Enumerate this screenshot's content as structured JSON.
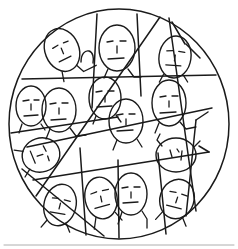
{
  "image": {
    "title": "Circle of Faces",
    "description": "Hand-drawn sketch of a large circle subdivided by straight chords into irregular sectors, each sector containing a simple cartoon person with an oval head, minimal facial features and shoulders.",
    "medium": "pen-and-ink line drawing",
    "background_color": "#ffffff",
    "ink_color": "#1a1a1a",
    "artifact_color": "#9b9b9b",
    "width": 238,
    "height": 249,
    "person_count": 15
  },
  "circle": {
    "name": "boundary-circle",
    "center_x": 119,
    "center_y": 124,
    "radius_x": 110,
    "radius_y": 115
  },
  "chords": [
    {
      "id": "chord-top-left-vertical",
      "x1": 97,
      "y1": 14,
      "x2": 92,
      "y2": 108
    },
    {
      "id": "chord-top-right-vertical",
      "x1": 137,
      "y1": 14,
      "x2": 141,
      "y2": 96
    },
    {
      "id": "chord-horizontal-upper",
      "x1": 22,
      "y1": 79,
      "x2": 216,
      "y2": 75
    },
    {
      "id": "chord-diagonal-main",
      "x1": 160,
      "y1": 17,
      "x2": 36,
      "y2": 196
    },
    {
      "id": "chord-diagonal-right-down",
      "x1": 169,
      "y1": 18,
      "x2": 196,
      "y2": 211
    },
    {
      "id": "chord-left-mid",
      "x1": 11,
      "y1": 133,
      "x2": 118,
      "y2": 117
    },
    {
      "id": "chord-mid-sweep",
      "x1": 27,
      "y1": 147,
      "x2": 212,
      "y2": 108
    },
    {
      "id": "chord-lower-sweep",
      "x1": 33,
      "y1": 180,
      "x2": 209,
      "y2": 152
    },
    {
      "id": "chord-bottom-left-diag",
      "x1": 22,
      "y1": 169,
      "x2": 104,
      "y2": 236
    },
    {
      "id": "chord-bottom-vertical-a",
      "x1": 80,
      "y1": 148,
      "x2": 86,
      "y2": 235
    },
    {
      "id": "chord-bottom-vertical-b",
      "x1": 118,
      "y1": 160,
      "x2": 119,
      "y2": 238
    },
    {
      "id": "chord-bottom-vertical-c",
      "x1": 158,
      "y1": 153,
      "x2": 166,
      "y2": 234
    },
    {
      "id": "chord-right-lower-edge",
      "x1": 196,
      "y1": 120,
      "x2": 186,
      "y2": 216
    },
    {
      "id": "chord-top-right-short",
      "x1": 185,
      "y1": 44,
      "x2": 172,
      "y2": 22
    },
    {
      "id": "chord-upper-right-wedge",
      "x1": 200,
      "y1": 58,
      "x2": 186,
      "y2": 44
    }
  ],
  "people": [
    {
      "id": "person-top-left",
      "label": "face-1",
      "cx": 62,
      "cy": 50,
      "rx": 17,
      "ry": 22,
      "rotation": -22,
      "expression": "neutral"
    },
    {
      "id": "person-top-center",
      "label": "face-2",
      "cx": 117,
      "cy": 48,
      "rx": 18,
      "ry": 23,
      "rotation": 0,
      "expression": "neutral"
    },
    {
      "id": "person-top-right",
      "label": "face-3",
      "cx": 175,
      "cy": 57,
      "rx": 16,
      "ry": 21,
      "rotation": 8,
      "expression": "neutral"
    },
    {
      "id": "person-left-upper",
      "label": "face-4",
      "cx": 31,
      "cy": 106,
      "rx": 15,
      "ry": 20,
      "rotation": 0,
      "expression": "neutral"
    },
    {
      "id": "person-left-mid",
      "label": "face-5",
      "cx": 59,
      "cy": 110,
      "rx": 17,
      "ry": 22,
      "rotation": 0,
      "expression": "neutral"
    },
    {
      "id": "person-center-upper",
      "label": "face-6",
      "cx": 105,
      "cy": 98,
      "rx": 16,
      "ry": 21,
      "rotation": 0,
      "expression": "neutral"
    },
    {
      "id": "person-center",
      "label": "face-7",
      "cx": 126,
      "cy": 121,
      "rx": 17,
      "ry": 22,
      "rotation": 0,
      "expression": "neutral"
    },
    {
      "id": "person-right-upper",
      "label": "face-8",
      "cx": 169,
      "cy": 103,
      "rx": 17,
      "ry": 23,
      "rotation": 0,
      "expression": "neutral"
    },
    {
      "id": "person-left-lower",
      "label": "face-9",
      "cx": 41,
      "cy": 155,
      "rx": 17,
      "ry": 19,
      "rotation": 72,
      "expression": "neutral"
    },
    {
      "id": "person-right-mid",
      "label": "face-10",
      "cx": 176,
      "cy": 155,
      "rx": 20,
      "ry": 17,
      "rotation": 0,
      "expression": "eyes-only"
    },
    {
      "id": "person-bottom-far-left",
      "label": "face-11",
      "cx": 60,
      "cy": 205,
      "rx": 16,
      "ry": 21,
      "rotation": 14,
      "expression": "neutral"
    },
    {
      "id": "person-bottom-left",
      "label": "face-12",
      "cx": 101,
      "cy": 198,
      "rx": 16,
      "ry": 21,
      "rotation": -12,
      "expression": "neutral"
    },
    {
      "id": "person-bottom-center",
      "label": "face-13",
      "cx": 131,
      "cy": 194,
      "rx": 16,
      "ry": 21,
      "rotation": 0,
      "expression": "neutral"
    },
    {
      "id": "person-bottom-right",
      "label": "face-14",
      "cx": 177,
      "cy": 199,
      "rx": 17,
      "ry": 20,
      "rotation": 18,
      "expression": "neutral"
    },
    {
      "id": "person-upper-mid-left",
      "label": "face-15",
      "cx": 86,
      "cy": 57,
      "rx": 5,
      "ry": 6,
      "rotation": 0,
      "expression": "partial"
    }
  ],
  "artifacts": [
    {
      "id": "bottom-edge-smudge",
      "x1": 4,
      "y1": 245,
      "x2": 234,
      "y2": 245
    }
  ]
}
